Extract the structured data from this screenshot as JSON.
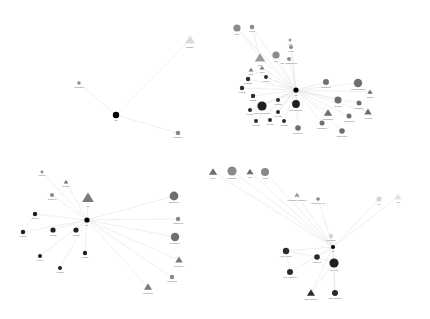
{
  "figure": {
    "title": "",
    "background": "#ffffff",
    "width": 430,
    "height": 319,
    "edge_color": "#e2e2e2",
    "ego_color": "#000000"
  },
  "palette": {
    "ego": "#000000",
    "very_dark": "#1f1f1f",
    "dark": "#2b2b2b",
    "mid_dark": "#454545",
    "mid": "#6f6f6f",
    "gray": "#8a8a8a",
    "light": "#b4b4b4",
    "very_light": "#d8d8d8",
    "faint": "#e6e6e6"
  },
  "networks": [
    {
      "id": "network-top-left",
      "ego": {
        "label": "Me",
        "x": 116,
        "y": 115,
        "r": 3.2,
        "color": "#000000",
        "shape": "circle"
      },
      "nodes": [
        {
          "label": "Teammate",
          "x": 79,
          "y": 83,
          "r": 1.7,
          "color": "#8a8a8a",
          "shape": "circle"
        },
        {
          "label": "Manager",
          "x": 190,
          "y": 40,
          "r": 5.0,
          "color": "#dcdcdc",
          "shape": "triangle"
        },
        {
          "label": "Coworker",
          "x": 178,
          "y": 133,
          "r": 2.3,
          "color": "#8a8a8a",
          "shape": "circle"
        }
      ],
      "edges": [
        [
          0,
          1
        ],
        [
          0,
          2
        ],
        [
          0,
          3
        ]
      ]
    },
    {
      "id": "network-top-right",
      "ego": {
        "label": "Me",
        "x": 296,
        "y": 90,
        "r": 2.6,
        "color": "#000000",
        "shape": "circle"
      },
      "nodes": [
        {
          "label": "Chat",
          "x": 237,
          "y": 28,
          "r": 3.6,
          "color": "#8a8a8a",
          "shape": "circle"
        },
        {
          "label": "Peer1",
          "x": 252,
          "y": 27,
          "r": 2.3,
          "color": "#8a8a8a",
          "shape": "circle"
        },
        {
          "label": "Grp1",
          "x": 260,
          "y": 58,
          "r": 5.0,
          "color": "#9a9a9a",
          "shape": "triangle"
        },
        {
          "label": "Mgr",
          "x": 276,
          "y": 55,
          "r": 3.6,
          "color": "#8a8a8a",
          "shape": "circle"
        },
        {
          "label": "Mgr_TeamPartner",
          "x": 289,
          "y": 59,
          "r": 2.0,
          "color": "#8a8a8a",
          "shape": "circle"
        },
        {
          "label": "Peer2",
          "x": 291,
          "y": 47,
          "r": 2.0,
          "color": "#8a8a8a",
          "shape": "circle"
        },
        {
          "label": "Asst",
          "x": 290,
          "y": 40,
          "r": 1.5,
          "color": "#9a9a9a",
          "shape": "circle"
        },
        {
          "label": "Grp2",
          "x": 251,
          "y": 70,
          "r": 2.3,
          "color": "#7a7a7a",
          "shape": "triangle"
        },
        {
          "label": "Grp3",
          "x": 262,
          "y": 68,
          "r": 2.3,
          "color": "#7a7a7a",
          "shape": "triangle"
        },
        {
          "label": "Friend1",
          "x": 266,
          "y": 77,
          "r": 2.0,
          "color": "#2b2b2b",
          "shape": "circle"
        },
        {
          "label": "FriendC1",
          "x": 248,
          "y": 79,
          "r": 2.2,
          "color": "#2b2b2b",
          "shape": "circle"
        },
        {
          "label": "Friend2",
          "x": 242,
          "y": 88,
          "r": 2.2,
          "color": "#2b2b2b",
          "shape": "circle"
        },
        {
          "label": "TeamB",
          "x": 253,
          "y": 96,
          "r": 2.2,
          "color": "#2b2b2b",
          "shape": "circle"
        },
        {
          "label": "ClosestFriend",
          "x": 296,
          "y": 104,
          "r": 3.9,
          "color": "#1f1f1f",
          "shape": "circle"
        },
        {
          "label": "MyBestFriendGrp",
          "x": 262,
          "y": 106,
          "r": 4.6,
          "color": "#1f1f1f",
          "shape": "circle"
        },
        {
          "label": "Friend3",
          "x": 278,
          "y": 100,
          "r": 2.0,
          "color": "#2b2b2b",
          "shape": "circle"
        },
        {
          "label": "Friend4",
          "x": 250,
          "y": 110,
          "r": 2.0,
          "color": "#2b2b2b",
          "shape": "circle"
        },
        {
          "label": "Friend5",
          "x": 278,
          "y": 112,
          "r": 2.0,
          "color": "#2b2b2b",
          "shape": "circle"
        },
        {
          "label": "Friend6",
          "x": 270,
          "y": 120,
          "r": 2.0,
          "color": "#2b2b2b",
          "shape": "circle"
        },
        {
          "label": "Friend7",
          "x": 256,
          "y": 121,
          "r": 2.0,
          "color": "#2b2b2b",
          "shape": "circle"
        },
        {
          "label": "Friend8",
          "x": 284,
          "y": 121,
          "r": 2.0,
          "color": "#2b2b2b",
          "shape": "circle"
        },
        {
          "label": "Coworker1",
          "x": 326,
          "y": 82,
          "r": 3.0,
          "color": "#6f6f6f",
          "shape": "circle"
        },
        {
          "label": "AcademicPartner",
          "x": 358,
          "y": 83,
          "r": 4.2,
          "color": "#6f6f6f",
          "shape": "circle"
        },
        {
          "label": "Advisor1",
          "x": 370,
          "y": 92,
          "r": 2.5,
          "color": "#6f6f6f",
          "shape": "triangle"
        },
        {
          "label": "Seminar",
          "x": 338,
          "y": 100,
          "r": 3.5,
          "color": "#6f6f6f",
          "shape": "circle"
        },
        {
          "label": "Coauthor",
          "x": 359,
          "y": 103,
          "r": 2.5,
          "color": "#6f6f6f",
          "shape": "circle"
        },
        {
          "label": "Advisor2",
          "x": 368,
          "y": 112,
          "r": 3.6,
          "color": "#6f6f6f",
          "shape": "triangle"
        },
        {
          "label": "Coworker2",
          "x": 349,
          "y": 116,
          "r": 2.5,
          "color": "#6f6f6f",
          "shape": "circle"
        },
        {
          "label": "Roommate",
          "x": 328,
          "y": 113,
          "r": 4.0,
          "color": "#6f6f6f",
          "shape": "triangle"
        },
        {
          "label": "Coworker3",
          "x": 322,
          "y": 123,
          "r": 2.5,
          "color": "#6f6f6f",
          "shape": "circle"
        },
        {
          "label": "Coworker4",
          "x": 298,
          "y": 128,
          "r": 2.8,
          "color": "#6f6f6f",
          "shape": "circle"
        },
        {
          "label": "Conference",
          "x": 342,
          "y": 131,
          "r": 2.8,
          "color": "#6f6f6f",
          "shape": "circle"
        }
      ],
      "edges": [
        [
          0,
          1
        ],
        [
          0,
          2
        ],
        [
          0,
          3
        ],
        [
          0,
          4
        ],
        [
          0,
          5
        ],
        [
          0,
          6
        ],
        [
          0,
          7
        ],
        [
          0,
          8
        ],
        [
          0,
          9
        ],
        [
          0,
          10
        ],
        [
          0,
          11
        ],
        [
          0,
          12
        ],
        [
          0,
          13
        ],
        [
          0,
          14
        ],
        [
          0,
          15
        ],
        [
          0,
          16
        ],
        [
          0,
          17
        ],
        [
          0,
          18
        ],
        [
          0,
          19
        ],
        [
          0,
          20
        ],
        [
          0,
          21
        ],
        [
          0,
          22
        ],
        [
          0,
          23
        ],
        [
          0,
          24
        ],
        [
          0,
          25
        ],
        [
          0,
          26
        ],
        [
          0,
          27
        ],
        [
          0,
          28
        ],
        [
          0,
          29
        ],
        [
          0,
          30
        ],
        [
          0,
          31
        ],
        [
          0,
          32
        ],
        [
          1,
          3
        ],
        [
          2,
          3
        ]
      ]
    },
    {
      "id": "network-bottom-left",
      "ego": {
        "label": "Me",
        "x": 87,
        "y": 220,
        "r": 2.6,
        "color": "#000000",
        "shape": "circle"
      },
      "nodes": [
        {
          "label": "Partner",
          "x": 42,
          "y": 172,
          "r": 1.4,
          "color": "#8a8a8a",
          "shape": "circle"
        },
        {
          "label": "Brother",
          "x": 66,
          "y": 182,
          "r": 2.2,
          "color": "#6f6f6f",
          "shape": "triangle"
        },
        {
          "label": "Relatives",
          "x": 52,
          "y": 195,
          "r": 2.0,
          "color": "#8a8a8a",
          "shape": "circle"
        },
        {
          "label": "Fm",
          "x": 88,
          "y": 198,
          "r": 5.6,
          "color": "#7a7a7a",
          "shape": "triangle"
        },
        {
          "label": "Parent",
          "x": 35,
          "y": 214,
          "r": 2.2,
          "color": "#1f1f1f",
          "shape": "circle"
        },
        {
          "label": "Friend1",
          "x": 23,
          "y": 232,
          "r": 2.2,
          "color": "#1f1f1f",
          "shape": "circle"
        },
        {
          "label": "Friend2",
          "x": 53,
          "y": 230,
          "r": 2.6,
          "color": "#1f1f1f",
          "shape": "circle"
        },
        {
          "label": "Friend3",
          "x": 76,
          "y": 230,
          "r": 2.6,
          "color": "#1f1f1f",
          "shape": "circle"
        },
        {
          "label": "Friend4",
          "x": 40,
          "y": 256,
          "r": 2.0,
          "color": "#1f1f1f",
          "shape": "circle"
        },
        {
          "label": "Friend5",
          "x": 60,
          "y": 268,
          "r": 2.0,
          "color": "#1f1f1f",
          "shape": "circle"
        },
        {
          "label": "Friend6",
          "x": 85,
          "y": 253,
          "r": 2.2,
          "color": "#1f1f1f",
          "shape": "circle"
        },
        {
          "label": "Coworker1",
          "x": 174,
          "y": 196,
          "r": 4.4,
          "color": "#6f6f6f",
          "shape": "circle"
        },
        {
          "label": "Coworker2",
          "x": 178,
          "y": 219,
          "r": 2.2,
          "color": "#8a8a8a",
          "shape": "circle"
        },
        {
          "label": "Coworker3",
          "x": 175,
          "y": 237,
          "r": 4.2,
          "color": "#6f6f6f",
          "shape": "circle"
        },
        {
          "label": "Coworker4",
          "x": 179,
          "y": 260,
          "r": 3.6,
          "color": "#7a7a7a",
          "shape": "triangle"
        },
        {
          "label": "Coworker5",
          "x": 172,
          "y": 277,
          "r": 2.2,
          "color": "#8a8a8a",
          "shape": "circle"
        },
        {
          "label": "Coworker6",
          "x": 148,
          "y": 287,
          "r": 3.8,
          "color": "#7a7a7a",
          "shape": "triangle"
        }
      ],
      "edges": [
        [
          0,
          1
        ],
        [
          0,
          2
        ],
        [
          0,
          3
        ],
        [
          0,
          4
        ],
        [
          0,
          5
        ],
        [
          0,
          6
        ],
        [
          0,
          7
        ],
        [
          0,
          8
        ],
        [
          0,
          9
        ],
        [
          0,
          10
        ],
        [
          0,
          11
        ],
        [
          0,
          12
        ],
        [
          0,
          13
        ],
        [
          0,
          14
        ],
        [
          0,
          15
        ],
        [
          0,
          16
        ],
        [
          0,
          17
        ],
        [
          5,
          6
        ],
        [
          8,
          0
        ]
      ]
    },
    {
      "id": "network-bottom-right",
      "ego": {
        "label": "Me",
        "x": 333,
        "y": 247,
        "r": 2.1,
        "color": "#000000",
        "shape": "circle"
      },
      "nodes": [
        {
          "label": "Colleague",
          "x": 331,
          "y": 236,
          "r": 2.2,
          "color": "#d4d4d4",
          "shape": "circle"
        },
        {
          "label": "Club",
          "x": 213,
          "y": 172,
          "r": 4.0,
          "color": "#6f6f6f",
          "shape": "triangle"
        },
        {
          "label": "Seminar1",
          "x": 232,
          "y": 171,
          "r": 4.6,
          "color": "#8a8a8a",
          "shape": "circle"
        },
        {
          "label": "Grp",
          "x": 250,
          "y": 172,
          "r": 3.4,
          "color": "#6f6f6f",
          "shape": "triangle"
        },
        {
          "label": "Grp2",
          "x": 265,
          "y": 172,
          "r": 4.0,
          "color": "#8a8a8a",
          "shape": "circle"
        },
        {
          "label": "Seminar2_Coworker",
          "x": 297,
          "y": 195,
          "r": 2.6,
          "color": "#9a9a9a",
          "shape": "triangle"
        },
        {
          "label": "Coworker1_ofc",
          "x": 318,
          "y": 199,
          "r": 1.8,
          "color": "#8a8a8a",
          "shape": "circle"
        },
        {
          "label": "Ref",
          "x": 379,
          "y": 199,
          "r": 2.6,
          "color": "#d4d4d4",
          "shape": "circle"
        },
        {
          "label": "Lab",
          "x": 398,
          "y": 197,
          "r": 3.4,
          "color": "#e0e0e0",
          "shape": "triangle"
        },
        {
          "label": "IRC_Guests",
          "x": 286,
          "y": 251,
          "r": 3.2,
          "color": "#2b2b2b",
          "shape": "circle"
        },
        {
          "label": "IRC_net1",
          "x": 317,
          "y": 257,
          "r": 2.8,
          "color": "#2b2b2b",
          "shape": "circle"
        },
        {
          "label": "IRC_staff",
          "x": 334,
          "y": 263,
          "r": 4.6,
          "color": "#1f1f1f",
          "shape": "circle"
        },
        {
          "label": "IRC_channel1",
          "x": 290,
          "y": 272,
          "r": 3.0,
          "color": "#2b2b2b",
          "shape": "circle"
        },
        {
          "label": "IRC_channel2",
          "x": 311,
          "y": 293,
          "r": 3.8,
          "color": "#2b2b2b",
          "shape": "triangle"
        },
        {
          "label": "IRC_channel3",
          "x": 335,
          "y": 293,
          "r": 3.0,
          "color": "#2b2b2b",
          "shape": "circle"
        }
      ],
      "edges": [
        [
          0,
          1
        ],
        [
          0,
          2
        ],
        [
          0,
          3
        ],
        [
          0,
          4
        ],
        [
          0,
          5
        ],
        [
          0,
          6
        ],
        [
          0,
          7
        ],
        [
          0,
          8
        ],
        [
          0,
          9
        ],
        [
          0,
          10
        ],
        [
          0,
          11
        ],
        [
          0,
          12
        ],
        [
          0,
          13
        ],
        [
          0,
          14
        ],
        [
          0,
          15
        ],
        [
          10,
          11
        ],
        [
          11,
          12
        ],
        [
          12,
          14
        ],
        [
          12,
          15
        ],
        [
          10,
          13
        ]
      ]
    }
  ]
}
